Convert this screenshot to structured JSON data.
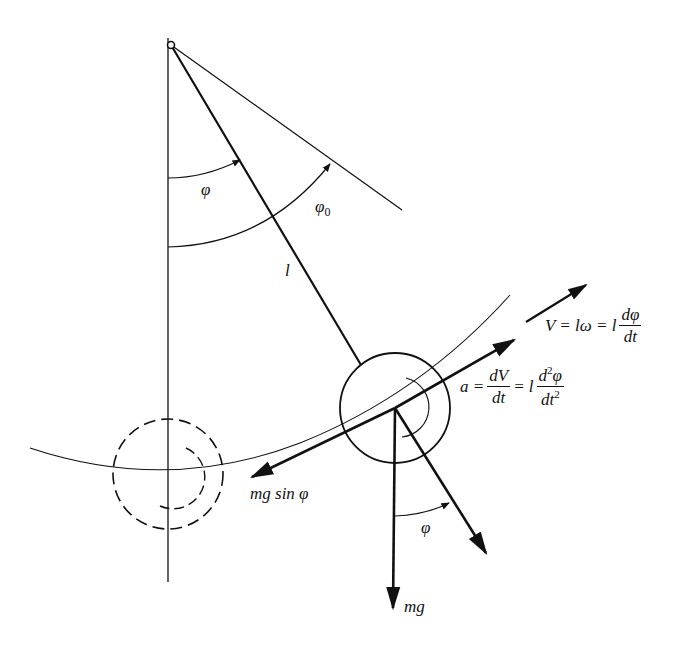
{
  "figure": {
    "labels": {
      "phi": "φ",
      "phi0": "φ",
      "phi0_sub": "0",
      "length": "l",
      "velocity_lhs": "V = lω = l",
      "velocity_num": "dφ",
      "velocity_den": "dt",
      "accel_lhs": "a =",
      "accel_num1": "dV",
      "accel_den1": "dt",
      "accel_mid": "= l",
      "accel_num2_a": "d",
      "accel_num2_sup": "2",
      "accel_num2_b": "φ",
      "accel_den2_a": "dt",
      "accel_den2_sup": "2",
      "tangential_force": "mg sin φ",
      "gravity": "mg",
      "phi_lower": "φ"
    },
    "colors": {
      "ink": "#111111",
      "background": "#ffffff"
    }
  }
}
